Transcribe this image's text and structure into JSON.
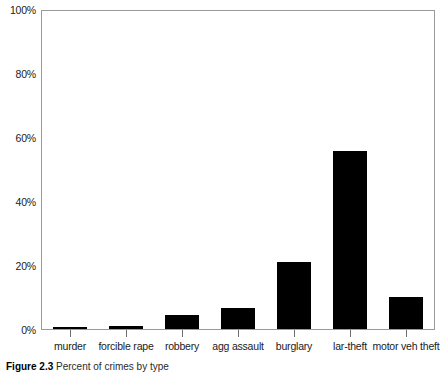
{
  "chart_data": {
    "type": "bar",
    "title": "",
    "xlabel": "",
    "ylabel": "",
    "categories": [
      "murder",
      "forcible rape",
      "robbery",
      "agg assault",
      "burglary",
      "lar-theft",
      "motor veh theft"
    ],
    "values": [
      0.2,
      1.0,
      4.4,
      6.5,
      21.0,
      56.0,
      10.0
    ],
    "value_unit": "percent",
    "ylim": [
      0,
      100
    ],
    "y_ticks": [
      0,
      20,
      40,
      60,
      80,
      100
    ],
    "y_tick_labels": [
      "0%",
      "20%",
      "40%",
      "60%",
      "80%",
      "100%"
    ],
    "grid": false,
    "legend": null,
    "bar_color": "#000000",
    "frame_color": "#9a9a9a"
  },
  "caption": {
    "label": "Figure 2.3",
    "text": "Percent of crimes by type"
  }
}
